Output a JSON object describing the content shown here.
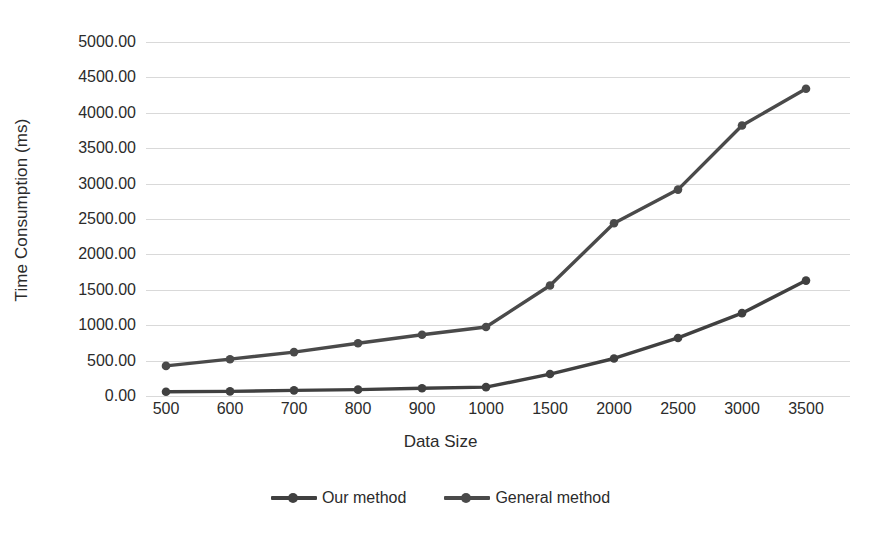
{
  "chart_data": {
    "type": "line",
    "title": "",
    "xlabel": "Data Size",
    "ylabel": "Time Consumption (ms)",
    "categories": [
      "500",
      "600",
      "700",
      "800",
      "900",
      "1000",
      "1500",
      "2000",
      "2500",
      "3000",
      "3500"
    ],
    "ylim": [
      0,
      5000
    ],
    "ytick_values": [
      0,
      500,
      1000,
      1500,
      2000,
      2500,
      3000,
      3500,
      4000,
      4500,
      5000
    ],
    "ytick_labels": [
      "0.00",
      "500.00",
      "1000.00",
      "1500.00",
      "2000.00",
      "2500.00",
      "3000.00",
      "3500.00",
      "4000.00",
      "4500.00",
      "5000.00"
    ],
    "grid": true,
    "grid_color": "#d9d9d9",
    "legend_position": "bottom",
    "series": [
      {
        "name": "Our method",
        "color": "#404040",
        "marker": "circle",
        "values": [
          60,
          65,
          80,
          90,
          110,
          125,
          310,
          530,
          820,
          1170,
          1630
        ]
      },
      {
        "name": "General method",
        "color": "#4a4a4a",
        "marker": "circle",
        "values": [
          425,
          520,
          620,
          745,
          865,
          975,
          1560,
          2440,
          2915,
          3820,
          4340
        ]
      }
    ]
  },
  "legend": {
    "items": [
      {
        "label": "Our method"
      },
      {
        "label": "General method"
      }
    ]
  },
  "axes": {
    "y_title": "Time Consumption (ms)",
    "x_title": "Data Size"
  }
}
